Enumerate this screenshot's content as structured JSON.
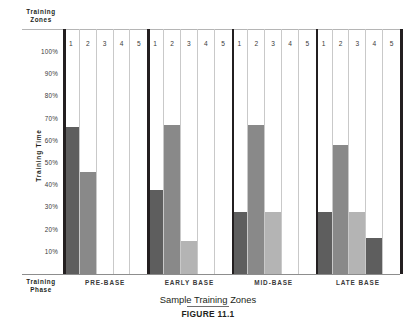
{
  "chart_data": {
    "type": "bar",
    "title": "Sample Training Zones",
    "figure_label": "FIGURE 11.1",
    "xlabel": "Training Phase",
    "ylabel": "Training Time",
    "zones_header": "Training\nZones",
    "phase_header": "Training\nPhase",
    "ylim": [
      0,
      100
    ],
    "ytick_labels": [
      "100%",
      "90%",
      "80%",
      "70%",
      "60%",
      "50%",
      "40%",
      "30%",
      "20%",
      "10%"
    ],
    "ytick_values": [
      100,
      90,
      80,
      70,
      60,
      50,
      40,
      30,
      20,
      10
    ],
    "zone_labels": [
      "1",
      "2",
      "3",
      "4",
      "5"
    ],
    "grid": true,
    "legend": "none",
    "zone_colors": [
      "#5e5e5e",
      "#898989",
      "#b4b4b4",
      "#5e5e5e",
      "#ffffff"
    ],
    "groups": [
      {
        "name": "PRE-BASE",
        "zones": [
          "1",
          "2",
          "3",
          "4",
          "5"
        ],
        "values": [
          66,
          46,
          0,
          0,
          0
        ]
      },
      {
        "name": "EARLY BASE",
        "zones": [
          "1",
          "2",
          "3",
          "4",
          "5"
        ],
        "values": [
          38,
          67,
          15,
          0,
          0
        ]
      },
      {
        "name": "MID-BASE",
        "zones": [
          "1",
          "2",
          "3",
          "4",
          "5"
        ],
        "values": [
          28,
          67,
          28,
          0,
          0
        ]
      },
      {
        "name": "LATE BASE",
        "zones": [
          "1",
          "2",
          "3",
          "4",
          "5"
        ],
        "values": [
          28,
          58,
          28,
          16,
          0
        ]
      }
    ]
  },
  "axis": {
    "y_title": "Training Time",
    "zones_line1": "Training",
    "zones_line2": "Zones",
    "phase_line1": "Training",
    "phase_line2": "Phase"
  },
  "captions": {
    "main": "Sample Training Zones",
    "figure": "FIGURE 11.1"
  }
}
